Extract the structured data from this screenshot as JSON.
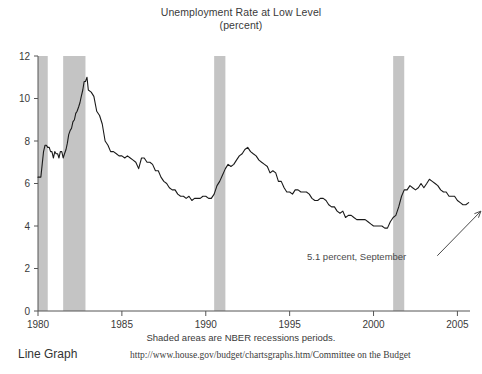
{
  "chart_data": {
    "type": "line",
    "title": "Unemployment Rate at Low Level",
    "subtitle": "(percent)",
    "xlabel": "",
    "ylabel": "",
    "ylim": [
      0,
      12
    ],
    "xlim": [
      1980,
      2005.75
    ],
    "yticks": [
      0,
      2,
      4,
      6,
      8,
      10,
      12
    ],
    "ytick_labels": [
      "0",
      "2",
      "4",
      "6",
      "8",
      "10",
      "12"
    ],
    "xticks": [
      1980,
      1985,
      1990,
      1995,
      2000,
      2005
    ],
    "xtick_labels": [
      "1980",
      "1985",
      "1990",
      "1995",
      "2000",
      "2005"
    ],
    "grid": false,
    "legend": "none",
    "series": [
      {
        "name": "Unemployment Rate",
        "color": "#1a1a1a",
        "x": [
          1980.0,
          1980.08,
          1980.17,
          1980.25,
          1980.33,
          1980.42,
          1980.5,
          1980.58,
          1980.67,
          1980.75,
          1980.83,
          1980.92,
          1981.0,
          1981.08,
          1981.17,
          1981.25,
          1981.33,
          1981.42,
          1981.5,
          1981.58,
          1981.67,
          1981.75,
          1981.83,
          1981.92,
          1982.0,
          1982.08,
          1982.17,
          1982.25,
          1982.33,
          1982.42,
          1982.5,
          1982.58,
          1982.67,
          1982.75,
          1982.83,
          1982.92,
          1983.0,
          1983.17,
          1983.33,
          1983.5,
          1983.67,
          1983.83,
          1984.0,
          1984.17,
          1984.33,
          1984.5,
          1984.67,
          1984.83,
          1985.0,
          1985.17,
          1985.33,
          1985.5,
          1985.67,
          1985.83,
          1986.0,
          1986.17,
          1986.33,
          1986.5,
          1986.67,
          1986.83,
          1987.0,
          1987.17,
          1987.33,
          1987.5,
          1987.67,
          1987.83,
          1988.0,
          1988.17,
          1988.33,
          1988.5,
          1988.67,
          1988.83,
          1989.0,
          1989.17,
          1989.33,
          1989.5,
          1989.67,
          1989.83,
          1990.0,
          1990.17,
          1990.33,
          1990.5,
          1990.67,
          1990.83,
          1991.0,
          1991.17,
          1991.33,
          1991.5,
          1991.67,
          1991.83,
          1992.0,
          1992.17,
          1992.33,
          1992.5,
          1992.67,
          1992.83,
          1993.0,
          1993.17,
          1993.33,
          1993.5,
          1993.67,
          1993.83,
          1994.0,
          1994.17,
          1994.33,
          1994.5,
          1994.67,
          1994.83,
          1995.0,
          1995.17,
          1995.33,
          1995.5,
          1995.67,
          1995.83,
          1996.0,
          1996.17,
          1996.33,
          1996.5,
          1996.67,
          1996.83,
          1997.0,
          1997.17,
          1997.33,
          1997.5,
          1997.67,
          1997.83,
          1998.0,
          1998.17,
          1998.33,
          1998.5,
          1998.67,
          1998.83,
          1999.0,
          1999.17,
          1999.33,
          1999.5,
          1999.67,
          1999.83,
          2000.0,
          2000.17,
          2000.33,
          2000.5,
          2000.67,
          2000.83,
          2001.0,
          2001.17,
          2001.33,
          2001.5,
          2001.67,
          2001.83,
          2002.0,
          2002.17,
          2002.33,
          2002.5,
          2002.67,
          2002.83,
          2003.0,
          2003.17,
          2003.33,
          2003.5,
          2003.67,
          2003.83,
          2004.0,
          2004.17,
          2004.33,
          2004.5,
          2004.67,
          2004.83,
          2005.0,
          2005.17,
          2005.33,
          2005.5,
          2005.67
        ],
        "y": [
          6.3,
          6.3,
          6.3,
          6.9,
          7.5,
          7.8,
          7.8,
          7.7,
          7.7,
          7.5,
          7.5,
          7.2,
          7.5,
          7.4,
          7.4,
          7.2,
          7.5,
          7.5,
          7.2,
          7.4,
          7.6,
          7.9,
          8.3,
          8.5,
          8.6,
          8.9,
          9.0,
          9.3,
          9.4,
          9.6,
          9.8,
          10.1,
          10.4,
          10.8,
          10.8,
          11.0,
          10.4,
          10.3,
          10.1,
          9.4,
          9.2,
          8.8,
          8.0,
          7.8,
          7.5,
          7.5,
          7.4,
          7.3,
          7.3,
          7.2,
          7.3,
          7.2,
          7.1,
          7.0,
          6.7,
          7.2,
          7.2,
          7.0,
          7.0,
          6.9,
          6.6,
          6.6,
          6.3,
          6.1,
          6.0,
          5.8,
          5.7,
          5.7,
          5.5,
          5.4,
          5.4,
          5.3,
          5.4,
          5.2,
          5.3,
          5.3,
          5.3,
          5.4,
          5.4,
          5.3,
          5.3,
          5.5,
          5.9,
          6.1,
          6.4,
          6.7,
          6.9,
          6.8,
          6.9,
          7.1,
          7.3,
          7.4,
          7.6,
          7.7,
          7.5,
          7.4,
          7.3,
          7.1,
          7.0,
          6.9,
          6.8,
          6.5,
          6.6,
          6.5,
          6.1,
          6.1,
          5.8,
          5.6,
          5.6,
          5.5,
          5.7,
          5.7,
          5.6,
          5.6,
          5.6,
          5.5,
          5.3,
          5.2,
          5.2,
          5.3,
          5.3,
          5.2,
          5.0,
          4.9,
          4.9,
          4.7,
          4.6,
          4.7,
          4.4,
          4.5,
          4.5,
          4.4,
          4.3,
          4.3,
          4.3,
          4.3,
          4.2,
          4.1,
          4.0,
          4.0,
          4.0,
          4.0,
          3.9,
          3.9,
          4.2,
          4.4,
          4.5,
          4.9,
          5.4,
          5.7,
          5.7,
          5.9,
          5.8,
          5.7,
          5.8,
          6.0,
          5.8,
          6.0,
          6.2,
          6.1,
          6.0,
          5.9,
          5.7,
          5.6,
          5.6,
          5.4,
          5.4,
          5.4,
          5.2,
          5.1,
          5.0,
          5.0,
          5.1
        ]
      }
    ],
    "shaded_regions": [
      {
        "label": "NBER recession 1980",
        "start": 1980.0,
        "end": 1980.58,
        "color": "#c4c4c4"
      },
      {
        "label": "NBER recession 1981-1982",
        "start": 1981.5,
        "end": 1982.83,
        "color": "#c4c4c4"
      },
      {
        "label": "NBER recession 1990-1991",
        "start": 1990.5,
        "end": 1991.17,
        "color": "#c4c4c4"
      },
      {
        "label": "NBER recession 2001",
        "start": 2001.17,
        "end": 2001.83,
        "color": "#c4c4c4"
      }
    ],
    "annotations": [
      {
        "text": "5.1 percent, September",
        "value": 5.1,
        "arrow_from": [
          2003.8,
          2.6
        ],
        "arrow_to": [
          2006.4,
          4.7
        ]
      }
    ],
    "caption": "Shaded areas are NBER recessions periods."
  },
  "footer": {
    "graph_type": "Line Graph",
    "source": "http://www.house.gov/budget/chartsgraphs.htm/Committee on the Budget"
  }
}
